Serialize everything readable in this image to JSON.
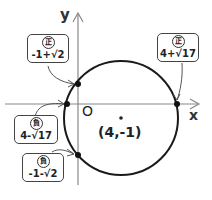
{
  "axes": {
    "x_label": "x",
    "y_label": "y",
    "origin_label": "O"
  },
  "circle": {
    "center_label": "(4,-1)",
    "center": [
      4,
      -1
    ],
    "radius_expr": "√17"
  },
  "intersections": [
    {
      "id": "y-positive",
      "sign": "正",
      "value": "-1+√2",
      "axis": "y"
    },
    {
      "id": "x-positive",
      "sign": "正",
      "value": "4+√17",
      "axis": "x"
    },
    {
      "id": "x-negative",
      "sign": "負",
      "value": "4-√17",
      "axis": "x"
    },
    {
      "id": "y-negative",
      "sign": "負",
      "value": "-1-√2",
      "axis": "y"
    }
  ],
  "colors": {
    "line": "#222222",
    "axis": "#777777",
    "box_border": "#444444"
  }
}
